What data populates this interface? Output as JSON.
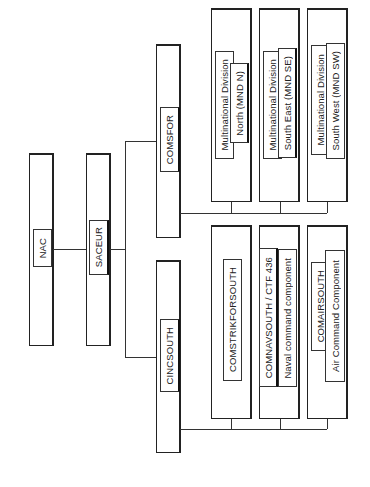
{
  "diagram": {
    "orientation": "rotated-90-ccw",
    "nodes": {
      "nac": {
        "label": "NAC"
      },
      "saceur": {
        "label": "SACEUR"
      },
      "comsfor": {
        "label": "COMSFOR"
      },
      "cincsouth": {
        "label": "CINCSOUTH"
      },
      "mnd_n": {
        "line1": "Multinational Division",
        "line2": "North (MND N)"
      },
      "mnd_se": {
        "line1": "Multinational Division",
        "line2": "South East (MND SE)"
      },
      "mnd_sw": {
        "line1": "Multinational Division",
        "line2": "South West (MND SW)"
      },
      "comstrikforsouth": {
        "label": "COMSTRIKFORSOUTH"
      },
      "comnavsouth": {
        "line1": "COMNAVSOUTH / CTF 436",
        "line2": "Naval command component"
      },
      "comairsouth": {
        "line1": "COMAIRSOUTH",
        "line2": "Air Command Component"
      }
    },
    "edges": [
      [
        "NAC",
        "SACEUR"
      ],
      [
        "SACEUR",
        "COMSFOR"
      ],
      [
        "SACEUR",
        "CINCSOUTH"
      ],
      [
        "COMSFOR",
        "Multinational Division North (MND N)"
      ],
      [
        "COMSFOR",
        "Multinational Division South East (MND SE)"
      ],
      [
        "COMSFOR",
        "Multinational Division South West (MND SW)"
      ],
      [
        "CINCSOUTH",
        "COMSTRIKFORSOUTH"
      ],
      [
        "CINCSOUTH",
        "COMNAVSOUTH / CTF 436"
      ],
      [
        "CINCSOUTH",
        "COMAIRSOUTH"
      ]
    ]
  }
}
